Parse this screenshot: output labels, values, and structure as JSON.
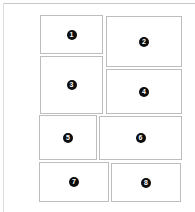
{
  "layout": {
    "frame_color": "#c8c8c8",
    "panel_border_color": "#bdbdbd",
    "badge_color": "#0d0d0d",
    "badge_text_color": "#ffffff"
  },
  "panels": [
    {
      "label": "1",
      "x": 40,
      "y": 15,
      "w": 63,
      "h": 39
    },
    {
      "label": "2",
      "x": 106,
      "y": 16,
      "w": 76,
      "h": 51
    },
    {
      "label": "3",
      "x": 40,
      "y": 56,
      "w": 63,
      "h": 58
    },
    {
      "label": "4",
      "x": 106,
      "y": 69,
      "w": 76,
      "h": 45
    },
    {
      "label": "5",
      "x": 39,
      "y": 115,
      "w": 58,
      "h": 45
    },
    {
      "label": "6",
      "x": 99,
      "y": 116,
      "w": 83,
      "h": 44
    },
    {
      "label": "7",
      "x": 39,
      "y": 162,
      "w": 70,
      "h": 40
    },
    {
      "label": "8",
      "x": 111,
      "y": 163,
      "w": 70,
      "h": 39
    }
  ]
}
